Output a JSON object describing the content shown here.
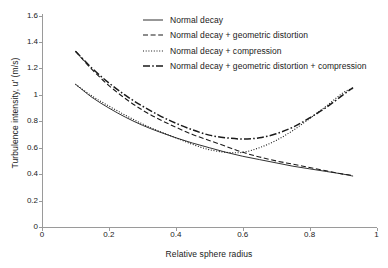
{
  "chart_data": {
    "type": "line",
    "title": "",
    "xlabel": "Relative sphere radius",
    "ylabel": "Turbulence intensity, u′ (m/s)",
    "xlim": [
      0,
      1
    ],
    "ylim": [
      0,
      1.6
    ],
    "xticks": [
      "0",
      "0.2",
      "0.4",
      "0.6",
      "0.8",
      "1"
    ],
    "xtick_values": [
      0,
      0.2,
      0.4,
      0.6,
      0.8,
      1
    ],
    "yticks": [
      "0",
      "0.2",
      "0.4",
      "0.6",
      "0.8",
      "1",
      "1.2",
      "1.4",
      "1.6"
    ],
    "ytick_values": [
      0,
      0.2,
      0.4,
      0.6,
      0.8,
      1,
      1.2,
      1.4,
      1.6
    ],
    "grid": false,
    "legend_position": "top-center",
    "line_color": "#1a1a1a",
    "series": [
      {
        "name": "Normal decay",
        "style": "solid",
        "x": [
          0.1,
          0.15,
          0.2,
          0.25,
          0.3,
          0.35,
          0.4,
          0.45,
          0.5,
          0.55,
          0.6,
          0.65,
          0.7,
          0.75,
          0.8,
          0.85,
          0.9,
          0.93
        ],
        "values": [
          1.08,
          0.98,
          0.9,
          0.83,
          0.77,
          0.72,
          0.675,
          0.635,
          0.6,
          0.565,
          0.535,
          0.51,
          0.485,
          0.46,
          0.44,
          0.42,
          0.4,
          0.385
        ]
      },
      {
        "name": "Normal decay + geometric distortion",
        "style": "dashed",
        "x": [
          0.1,
          0.15,
          0.2,
          0.25,
          0.3,
          0.35,
          0.4,
          0.45,
          0.5,
          0.55,
          0.6,
          0.65,
          0.7,
          0.75,
          0.8,
          0.85,
          0.9,
          0.93
        ],
        "values": [
          1.33,
          1.19,
          1.07,
          0.97,
          0.885,
          0.815,
          0.755,
          0.7,
          0.655,
          0.61,
          0.565,
          0.53,
          0.5,
          0.475,
          0.45,
          0.425,
          0.4,
          0.39
        ]
      },
      {
        "name": "Normal decay + compression",
        "style": "dotted",
        "x": [
          0.1,
          0.15,
          0.2,
          0.25,
          0.3,
          0.35,
          0.4,
          0.45,
          0.5,
          0.55,
          0.6,
          0.65,
          0.7,
          0.75,
          0.8,
          0.85,
          0.9,
          0.93
        ],
        "values": [
          1.08,
          0.99,
          0.915,
          0.845,
          0.78,
          0.725,
          0.675,
          0.625,
          0.585,
          0.565,
          0.565,
          0.6,
          0.655,
          0.73,
          0.82,
          0.915,
          1.015,
          1.05
        ]
      },
      {
        "name": "Normal decay + geometric distortion + compression",
        "style": "dashdot",
        "x": [
          0.1,
          0.15,
          0.2,
          0.25,
          0.3,
          0.35,
          0.4,
          0.45,
          0.5,
          0.55,
          0.6,
          0.65,
          0.7,
          0.75,
          0.8,
          0.85,
          0.9,
          0.93
        ],
        "values": [
          1.33,
          1.2,
          1.09,
          0.995,
          0.915,
          0.845,
          0.785,
          0.735,
          0.695,
          0.675,
          0.665,
          0.675,
          0.705,
          0.755,
          0.825,
          0.905,
          1.0,
          1.055
        ]
      }
    ]
  },
  "legend": {
    "items": [
      {
        "label": "Normal decay",
        "style": "solid"
      },
      {
        "label": "Normal decay + geometric distortion",
        "style": "dashed"
      },
      {
        "label": "Normal decay + compression",
        "style": "dotted"
      },
      {
        "label": "Normal decay + geometric distortion + compression",
        "style": "dashdot"
      }
    ]
  }
}
